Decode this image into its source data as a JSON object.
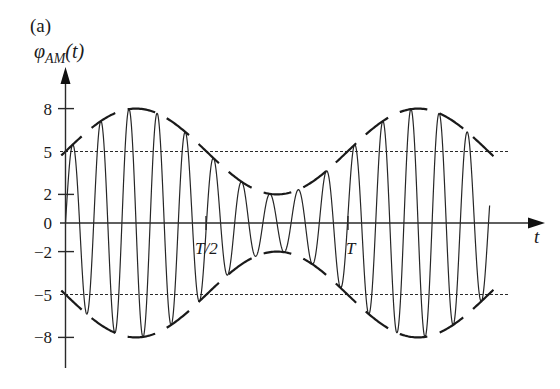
{
  "figure": {
    "panel_label": "(a)",
    "y_label": {
      "symbol": "φ",
      "subscript": "AM",
      "arg": "(t)"
    },
    "x_label": "t"
  },
  "chart_data": {
    "type": "line",
    "title": "",
    "panel": "(a)",
    "xlabel": "t",
    "ylabel": "φ_AM(t)",
    "ylim": [
      -8,
      8
    ],
    "x_range_in_T": [
      0,
      1.5
    ],
    "grid": false,
    "legend": null,
    "y_ticks": [
      8,
      5,
      2,
      0,
      -2,
      -5,
      -8
    ],
    "y_tick_labels": [
      "8",
      "5",
      "2",
      "0",
      "−2",
      "−5",
      "−8"
    ],
    "x_ticks": [
      {
        "t_over_T": 0.5,
        "label": "T/2"
      },
      {
        "t_over_T": 1.0,
        "label": "T"
      }
    ],
    "reference_lines": [
      {
        "y": 5,
        "style": "dotted"
      },
      {
        "y": -5,
        "style": "dotted"
      }
    ],
    "envelope": {
      "offset": 5,
      "amplitude": 3,
      "period_in_T": 1,
      "formula": "5 + 3 sin(2πt/T)"
    },
    "carrier_cycles_per_T": 10,
    "series": [
      {
        "name": "upper envelope",
        "style": "long-dashed",
        "x_in_T": [
          0,
          0.25,
          0.5,
          0.75,
          1.0,
          1.25,
          1.5
        ],
        "values": [
          5,
          8,
          5,
          2,
          5,
          8,
          5
        ]
      },
      {
        "name": "lower envelope",
        "style": "long-dashed",
        "x_in_T": [
          0,
          0.25,
          0.5,
          0.75,
          1.0,
          1.25,
          1.5
        ],
        "values": [
          -5,
          -8,
          -5,
          -2,
          -5,
          -8,
          -5
        ]
      },
      {
        "name": "φ_AM(t)",
        "style": "solid",
        "formula": "[5 + 3 sin(2πt/T)] · sin(20πt/T)",
        "x_in_T": [
          0,
          0.025,
          0.275,
          0.525,
          0.775,
          1.025,
          1.275,
          1.475
        ],
        "values": [
          0,
          5.47,
          7.96,
          4.53,
          2.0,
          5.47,
          7.96,
          5.0
        ]
      }
    ]
  }
}
